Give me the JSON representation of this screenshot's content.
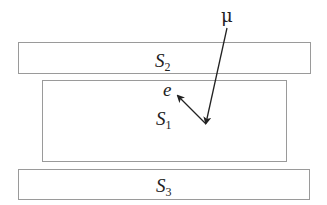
{
  "diagram": {
    "layers": [
      {
        "id": "S2",
        "label": "S",
        "subscript": "2",
        "x": 18,
        "y": 42,
        "w": 292,
        "h": 31
      },
      {
        "id": "S1",
        "label": "S",
        "subscript": "1",
        "x": 42,
        "y": 80,
        "w": 244,
        "h": 81
      },
      {
        "id": "S3",
        "label": "S",
        "subscript": "3",
        "x": 18,
        "y": 169,
        "w": 291,
        "h": 30
      }
    ],
    "muon": {
      "label": "μ",
      "start": [
        227,
        28
      ],
      "end": [
        206,
        124
      ]
    },
    "electron": {
      "label": "e",
      "start": [
        206,
        124
      ],
      "end": [
        177,
        95
      ]
    },
    "colors": {
      "box_border": "#9a9a9a",
      "line": "#222222",
      "text": "#222222"
    }
  }
}
